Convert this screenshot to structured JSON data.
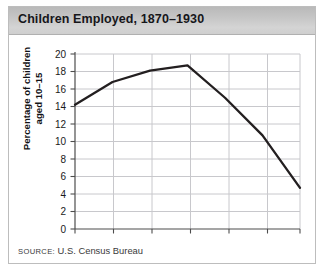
{
  "figure": {
    "title": "Children Employed, 1870–1930",
    "source_word": "SOURCE:",
    "source_value": "U.S. Census Bureau"
  },
  "axis": {
    "ylabel_line1": "Percentage of children",
    "ylabel_line2": "aged 10–15",
    "yticks": [
      "0",
      "2",
      "4",
      "6",
      "8",
      "10",
      "12",
      "14",
      "16",
      "18",
      "20"
    ],
    "xticks": [
      "1870",
      "1880",
      "1890",
      "1900",
      "1910",
      "1920",
      "1930"
    ]
  },
  "colors": {
    "line": "#231f20",
    "grid": "#c8c8cc",
    "axis": "#4d4d4d",
    "title_bar_top": "#b9b9b9",
    "title_bar_bottom": "#cfcfcf",
    "frame_border": "#bdbdbd",
    "background": "#ffffff"
  },
  "chart_data": {
    "type": "line",
    "title": "Children Employed, 1870–1930",
    "xlabel": "",
    "ylabel": "Percentage of children aged 10–15",
    "x": [
      1870,
      1880,
      1890,
      1900,
      1910,
      1920,
      1930
    ],
    "values": [
      14.2,
      16.8,
      18.1,
      18.7,
      15.0,
      10.7,
      4.7
    ],
    "series": [
      {
        "name": "Percentage of children aged 10–15 employed",
        "values": [
          14.2,
          16.8,
          18.1,
          18.7,
          15.0,
          10.7,
          4.7
        ]
      }
    ],
    "xlim": [
      1870,
      1930
    ],
    "ylim": [
      0,
      20
    ],
    "ytick_step": 2,
    "xtick_step": 10,
    "grid": "horizontal-and-vertical",
    "legend": "none",
    "source": "U.S. Census Bureau"
  }
}
